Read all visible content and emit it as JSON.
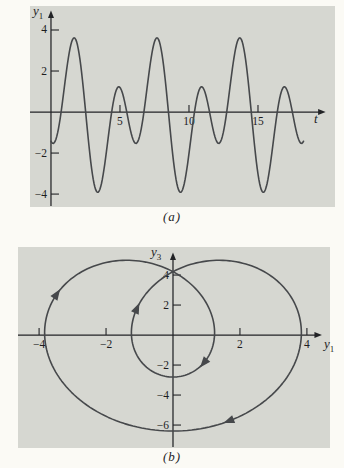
{
  "page": {
    "background": "#fbfaf5"
  },
  "colors": {
    "panel_bg": "#d6d7d1",
    "curve": "#46484b",
    "axis": "#222326",
    "text": "#1d1d1f"
  },
  "chart_data": [
    {
      "id": "a",
      "type": "line",
      "caption": "(a)",
      "xlabel": {
        "text": "t",
        "sub": ""
      },
      "ylabel": {
        "text": "y",
        "sub": "1"
      },
      "x_ticks": [
        5,
        10,
        15
      ],
      "y_ticks": [
        4,
        2,
        -2,
        -4
      ],
      "window": {
        "x": [
          -1.52,
          20.58
        ],
        "y": [
          -4.63,
          5.17
        ]
      },
      "axis_end": {
        "x": 19.9,
        "y": 4.95
      },
      "grid": false,
      "series": {
        "name": "y1(t)",
        "param": "t",
        "domain": [
          0,
          18.35
        ],
        "step": 0.06,
        "x_fn": {
          "identity": true
        },
        "y_fn": {
          "offset": -0.15,
          "terms": [
            [
              -1.7,
              1.0472,
              3.6303
            ],
            [
              -2.5,
              2.0944,
              0.9774
            ]
          ]
        },
        "features": {
          "period": 6.0,
          "large_maxima": 3.6,
          "large_maxima_t": [
            1.7,
            7.7,
            13.7
          ],
          "deep_minima": -3.9,
          "deep_minima_t": [
            3.4,
            9.4,
            15.4
          ],
          "small_maxima": 1.2,
          "small_maxima_t": [
            4.9,
            10.9,
            16.9
          ],
          "shallow_minima": -1.4,
          "start_value": -1.1
        }
      },
      "curve_arrows": []
    },
    {
      "id": "b",
      "type": "parametric",
      "caption": "(b)",
      "xlabel": {
        "text": "y",
        "sub": "1"
      },
      "ylabel": {
        "text": "y",
        "sub": "3"
      },
      "x_ticks": [
        -4,
        -2,
        2,
        4
      ],
      "y_ticks": [
        4,
        2,
        -2,
        -4,
        -6
      ],
      "window": {
        "x": [
          -4.63,
          4.69
        ],
        "y": [
          -7.53,
          5.87
        ]
      },
      "axis_end": {
        "x": 4.45,
        "y": 5.5
      },
      "grid": false,
      "series": {
        "name": "trajectory (y1, y3)",
        "param": "u",
        "domain": [
          0,
          6.2832
        ],
        "step": 0.02,
        "x_fn": {
          "offset": 0,
          "terms": [
            [
              -1.85,
              1,
              0
            ],
            [
              -2.45,
              2,
              0
            ]
          ]
        },
        "y_fn": {
          "offset": 0.15,
          "terms": [
            [
              -1.8,
              1,
              1.5708
            ],
            [
              -4.75,
              2,
              1.5708
            ]
          ]
        },
        "features": {
          "closed_curve": true,
          "self_intersection": [
            0.1,
            4.25
          ],
          "outer_loop_x_extent": [
            -3.9,
            3.85
          ],
          "outer_loop_bottom": -6.4,
          "inner_loop_x_extent": [
            -1.25,
            1.3
          ],
          "inner_loop_bottom": -2.8,
          "top_humps_y": 5.0
        }
      },
      "curve_arrows": [
        {
          "x": -3.49,
          "y": 2.67,
          "angle": -56
        },
        {
          "x": -1.09,
          "y": 1.71,
          "angle": -66
        },
        {
          "x": 0.94,
          "y": -1.8,
          "angle": 130
        },
        {
          "x": 1.7,
          "y": -5.7,
          "angle": 159
        }
      ]
    }
  ]
}
